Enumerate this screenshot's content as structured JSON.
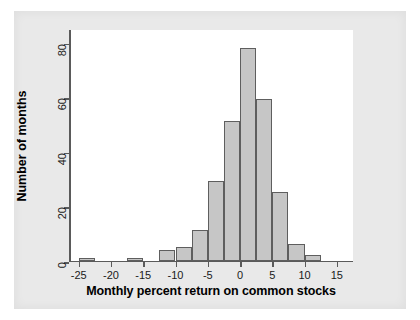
{
  "chart_data": {
    "type": "bar",
    "title": "",
    "subtitle": "",
    "xlabel": "Monthly percent return on common stocks",
    "ylabel": "Number of months",
    "xlim": [
      -26.5,
      17.5
    ],
    "ylim": [
      0,
      85
    ],
    "xticks": [
      -25,
      -20,
      -15,
      -10,
      -5,
      0,
      5,
      10,
      15
    ],
    "xtick_labels": [
      "-25",
      "-20",
      "-15",
      "-10",
      "-5",
      "0",
      "5",
      "10",
      "15"
    ],
    "yticks": [
      0,
      20,
      40,
      60,
      80
    ],
    "ytick_labels": [
      "0",
      "20",
      "40",
      "60",
      "80"
    ],
    "grid": false,
    "legend": null,
    "bin_width": 2.5,
    "bar_fill_color": "#c6c6c6",
    "bar_edge_color": "#5e5e5e",
    "plot_background_color": "#ffffff",
    "figure_background_color": "#e9e9e9",
    "bins": [
      {
        "left": -25.0,
        "right": -22.5,
        "center": -23.75,
        "count": 1
      },
      {
        "left": -17.5,
        "right": -15.0,
        "center": -16.25,
        "count": 1
      },
      {
        "left": -12.5,
        "right": -10.0,
        "center": -11.25,
        "count": 4
      },
      {
        "left": -10.0,
        "right": -7.5,
        "center": -8.75,
        "count": 5
      },
      {
        "left": -7.5,
        "right": -5.0,
        "center": -6.25,
        "count": 11
      },
      {
        "left": -5.0,
        "right": -2.5,
        "center": -3.75,
        "count": 29
      },
      {
        "left": -2.5,
        "right": 0.0,
        "center": -1.25,
        "count": 51
      },
      {
        "left": 0.0,
        "right": 2.5,
        "center": 1.25,
        "count": 78
      },
      {
        "left": 2.5,
        "right": 5.0,
        "center": 3.75,
        "count": 59
      },
      {
        "left": 5.0,
        "right": 7.5,
        "center": 6.25,
        "count": 25
      },
      {
        "left": 7.5,
        "right": 10.0,
        "center": 8.75,
        "count": 6
      },
      {
        "left": 10.0,
        "right": 12.5,
        "center": 11.25,
        "count": 2
      }
    ],
    "categories": [
      "-23.75",
      "-16.25",
      "-11.25",
      "-8.75",
      "-6.25",
      "-3.75",
      "-1.25",
      "1.25",
      "3.75",
      "6.25",
      "8.75",
      "11.25"
    ],
    "values": [
      1,
      1,
      4,
      5,
      11,
      29,
      51,
      78,
      59,
      25,
      6,
      2
    ]
  }
}
